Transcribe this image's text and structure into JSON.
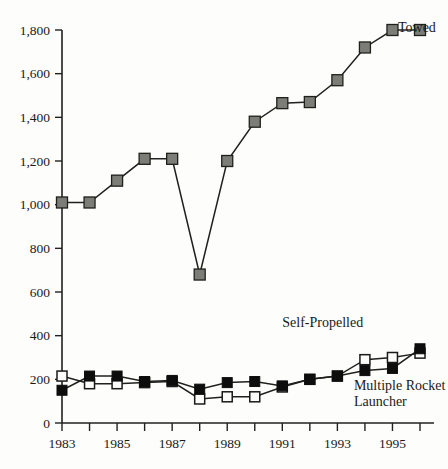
{
  "chart_data": {
    "type": "line",
    "title": "",
    "xlabel": "",
    "ylabel": "",
    "xlim": [
      1983,
      1996
    ],
    "ylim": [
      0,
      1800
    ],
    "grid": false,
    "legend_position": "inline-annotations",
    "x": [
      1983,
      1984,
      1985,
      1986,
      1987,
      1988,
      1989,
      1990,
      1991,
      1992,
      1993,
      1994,
      1995,
      1996
    ],
    "xtick_labels": [
      "1983",
      "",
      "1985",
      "",
      "1987",
      "",
      "1989",
      "",
      "1991",
      "",
      "1993",
      "",
      "1995",
      ""
    ],
    "ytick_labels": [
      "0",
      "200",
      "400",
      "600",
      "800",
      "1,000",
      "1,200",
      "1,400",
      "1,600",
      "1,800"
    ],
    "ytick_values": [
      0,
      200,
      400,
      600,
      800,
      1000,
      1200,
      1400,
      1600,
      1800
    ],
    "series": [
      {
        "name": "Towed",
        "marker": "gray-square",
        "color": "#7d7d78",
        "values": [
          1010,
          1010,
          1110,
          1210,
          1210,
          680,
          1200,
          1380,
          1465,
          1470,
          1570,
          1720,
          1800,
          1800
        ]
      },
      {
        "name": "Self-Propelled",
        "marker": "open-square",
        "color": "#fdfdfb",
        "values": [
          215,
          180,
          180,
          185,
          190,
          110,
          120,
          120,
          165,
          200,
          215,
          290,
          300,
          320
        ]
      },
      {
        "name": "Multiple Rocket Launcher",
        "marker": "filled-square",
        "color": "#0d0d0d",
        "values": [
          150,
          215,
          215,
          190,
          195,
          155,
          185,
          190,
          170,
          200,
          215,
          240,
          250,
          340
        ]
      }
    ],
    "annotations": [
      {
        "text": "Towed",
        "x": 1995.2,
        "y": 1790
      },
      {
        "text": "Self-Propelled",
        "x": 1991.0,
        "y": 440
      },
      {
        "text": "Multiple Rocket",
        "x": 1993.6,
        "y": 150
      },
      {
        "text": "Launcher",
        "x": 1993.6,
        "y": 80
      }
    ]
  },
  "annotation_labels": {
    "towed": "Towed",
    "self_propelled": "Self-Propelled",
    "mrl_line1": "Multiple Rocket",
    "mrl_line2": "Launcher"
  }
}
